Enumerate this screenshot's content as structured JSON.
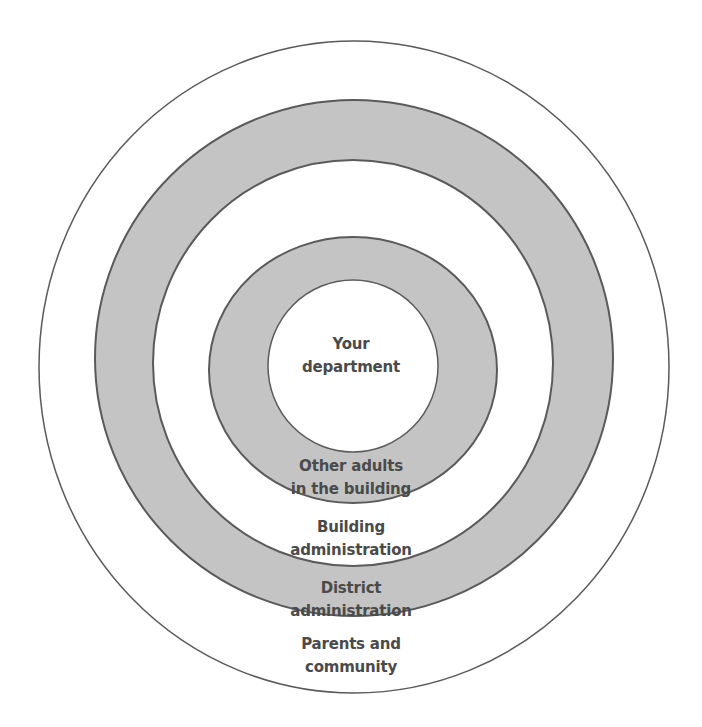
{
  "diagram": {
    "type": "concentric-circles",
    "colors": {
      "stroke": "#5a5a5a",
      "shaded": "#c4c4c4",
      "blank": "#ffffff",
      "text": "#4a4a4a"
    },
    "rings": [
      {
        "id": "parents-community",
        "lines": [
          "Parents and",
          "community"
        ],
        "fill": "white"
      },
      {
        "id": "district-administration",
        "lines": [
          "District",
          "administration"
        ],
        "fill": "gray"
      },
      {
        "id": "building-administration",
        "lines": [
          "Building",
          "administration"
        ],
        "fill": "white"
      },
      {
        "id": "other-adults",
        "lines": [
          "Other adults",
          "in the building"
        ],
        "fill": "gray"
      },
      {
        "id": "your-department",
        "lines": [
          "Your",
          "department"
        ],
        "fill": "white"
      }
    ]
  }
}
